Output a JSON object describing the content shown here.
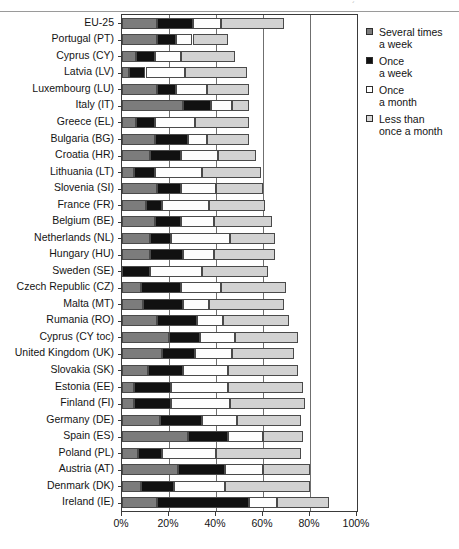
{
  "chart_data": {
    "type": "bar",
    "orientation": "horizontal",
    "stacked": true,
    "title": "",
    "xlabel": "",
    "ylabel": "",
    "xlim": [
      0,
      100
    ],
    "xticks": [
      "0%",
      "20%",
      "40%",
      "60%",
      "80%",
      "100%"
    ],
    "xtick_values": [
      0,
      20,
      40,
      60,
      80,
      100
    ],
    "grid": true,
    "legend_position": "right",
    "series": [
      {
        "name": "Several times a week",
        "color": "#7c7c7c",
        "values": [
          15,
          15,
          6,
          3,
          15,
          26,
          6,
          14,
          12,
          5,
          15,
          10,
          14,
          12,
          12,
          0,
          8,
          9,
          15,
          20,
          17,
          11,
          5,
          5,
          16,
          28,
          7,
          24,
          8,
          15
        ]
      },
      {
        "name": "Once a week",
        "color": "#111111",
        "values": [
          15,
          8,
          8,
          7,
          8,
          12,
          8,
          14,
          13,
          9,
          10,
          7,
          11,
          9,
          14,
          12,
          17,
          17,
          17,
          13,
          14,
          15,
          16,
          16,
          18,
          17,
          10,
          20,
          14,
          39
        ]
      },
      {
        "name": "Once a month",
        "color": "#ffffff",
        "values": [
          12,
          7,
          11,
          17,
          13,
          9,
          17,
          8,
          16,
          20,
          15,
          20,
          14,
          25,
          13,
          22,
          17,
          11,
          11,
          15,
          16,
          19,
          24,
          25,
          15,
          15,
          23,
          16,
          22,
          12
        ]
      },
      {
        "name": "Less than once a month",
        "color": "#d2d2d2",
        "values": [
          27,
          15,
          23,
          26,
          18,
          7,
          23,
          18,
          16,
          25,
          20,
          24,
          25,
          19,
          26,
          28,
          28,
          32,
          28,
          27,
          26,
          30,
          32,
          32,
          27,
          17,
          36,
          20,
          36,
          22
        ]
      }
    ],
    "categories": [
      "EU-25",
      "Portugal (PT)",
      "Cyprus (CY)",
      "Latvia (LV)",
      "Luxembourg (LU)",
      "Italy (IT)",
      "Greece (EL)",
      "Bulgaria (BG)",
      "Croatia (HR)",
      "Lithuania (LT)",
      "Slovenia (SI)",
      "France (FR)",
      "Belgium (BE)",
      "Netherlands (NL)",
      "Hungary (HU)",
      "Sweden (SE)",
      "Czech Republic (CZ)",
      "Malta (MT)",
      "Rumania (RO)",
      "Cyprus (CY toc)",
      "United Kingdom (UK)",
      "Slovakia (SK)",
      "Estonia (EE)",
      "Finland (FI)",
      "Germany (DE)",
      "Spain (ES)",
      "Poland (PL)",
      "Austria (AT)",
      "Denmark (DK)",
      "Ireland (IE)"
    ]
  },
  "legend": {
    "entries": [
      {
        "swatch": "several-times-a-week-swatch",
        "line1": "Several times",
        "line2": "a week"
      },
      {
        "swatch": "once-a-week-swatch",
        "line1": "Once",
        "line2": "a week"
      },
      {
        "swatch": "once-a-month-swatch",
        "line1": "Once",
        "line2": "a month"
      },
      {
        "swatch": "less-than-once-a-month-swatch",
        "line1": "Less than",
        "line2": "once a month"
      }
    ]
  },
  "decorations": {
    "top_tick_glyph": "´"
  }
}
